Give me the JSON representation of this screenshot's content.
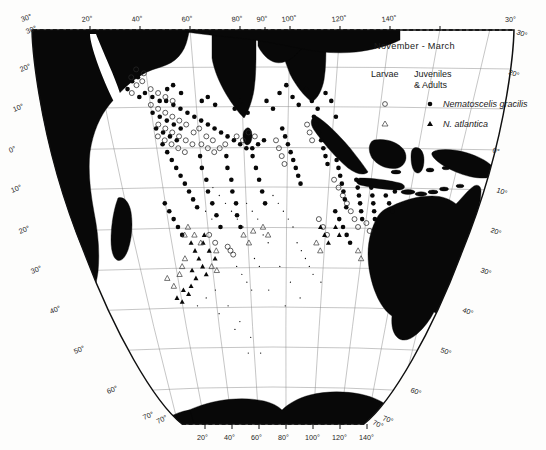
{
  "figure": {
    "kind": "distribution-map",
    "region": "Indian Ocean",
    "projection": "conic",
    "background": "#fdfdfc",
    "land_color": "#080808",
    "grid_color": "#8d8d8d"
  },
  "legend": {
    "season": "November - March",
    "col_larvae": "Larvae",
    "col_juv_line1": "Juveniles",
    "col_juv_line2": "& Adults",
    "entries": [
      {
        "species": "Nematoscelis gracilis",
        "larvae_symbol": "open-circle",
        "adult_symbol": "filled-circle"
      },
      {
        "species": "N. atlantica",
        "larvae_symbol": "open-triangle",
        "adult_symbol": "filled-triangle"
      }
    ]
  },
  "axes": {
    "top_longitudes": [
      "20°",
      "40°",
      "60°",
      "80°",
      "90°",
      "100°",
      "120°",
      "140°"
    ],
    "bottom_longitudes": [
      "20°",
      "40°",
      "60°",
      "80°",
      "100°",
      "120°",
      "140°"
    ],
    "left_latitudes": [
      "30°",
      "20°",
      "10°",
      "0°",
      "10°",
      "20°",
      "30°",
      "40°",
      "50°",
      "60°",
      "70°"
    ],
    "right_latitudes": [
      "30°",
      "20°",
      "0°",
      "10°",
      "20°",
      "30°",
      "40°",
      "50°",
      "60°",
      "70°"
    ],
    "corner_top_left": "30°",
    "corner_top_right": "30°",
    "corner_bottom_left": "70°",
    "corner_bottom_right": "70°"
  },
  "chart_data": {
    "type": "scatter",
    "title": "November - March",
    "xlabel": "Longitude (°E)",
    "ylabel": "Latitude",
    "xlim": [
      15,
      150
    ],
    "ylim": [
      -72,
      32
    ],
    "grid": true,
    "legend_position": "top-right",
    "series": [
      {
        "name": "Nematoscelis gracilis — Juveniles & Adults",
        "symbol": "filled-circle",
        "points": [
          [
            41,
            13
          ],
          [
            43,
            14
          ],
          [
            45,
            13
          ],
          [
            47,
            12
          ],
          [
            49,
            12
          ],
          [
            51,
            11
          ],
          [
            53,
            10
          ],
          [
            55,
            9
          ],
          [
            57,
            8
          ],
          [
            59,
            7
          ],
          [
            61,
            6
          ],
          [
            63,
            5
          ],
          [
            65,
            4
          ],
          [
            67,
            3
          ],
          [
            69,
            2
          ],
          [
            71,
            1
          ],
          [
            73,
            0
          ],
          [
            75,
            0
          ],
          [
            77,
            1
          ],
          [
            79,
            2
          ],
          [
            44,
            9
          ],
          [
            46,
            8
          ],
          [
            48,
            7
          ],
          [
            50,
            6
          ],
          [
            52,
            5
          ],
          [
            44,
            5
          ],
          [
            46,
            4
          ],
          [
            48,
            3
          ],
          [
            50,
            2
          ],
          [
            45,
            1
          ],
          [
            46,
            -1
          ],
          [
            47,
            -3
          ],
          [
            48,
            -5
          ],
          [
            49,
            -7
          ],
          [
            50,
            -9
          ],
          [
            51,
            -11
          ],
          [
            52,
            -13
          ],
          [
            53,
            -15
          ],
          [
            57,
            -2
          ],
          [
            57,
            -5
          ],
          [
            58,
            -8
          ],
          [
            58,
            -11
          ],
          [
            59,
            -14
          ],
          [
            60,
            -17
          ],
          [
            61,
            -20
          ],
          [
            66,
            -2
          ],
          [
            66,
            -5
          ],
          [
            67,
            -8
          ],
          [
            67,
            -11
          ],
          [
            68,
            -14
          ],
          [
            68,
            -17
          ],
          [
            69,
            -20
          ],
          [
            75,
            -2
          ],
          [
            76,
            -5
          ],
          [
            77,
            -8
          ],
          [
            78,
            -11
          ],
          [
            79,
            -14
          ],
          [
            85,
            5
          ],
          [
            86,
            3
          ],
          [
            87,
            1
          ],
          [
            88,
            -1
          ],
          [
            89,
            -3
          ],
          [
            90,
            -5
          ],
          [
            91,
            -7
          ],
          [
            92,
            -9
          ],
          [
            95,
            8
          ],
          [
            96,
            6
          ],
          [
            97,
            4
          ],
          [
            98,
            2
          ],
          [
            99,
            0
          ],
          [
            100,
            -2
          ],
          [
            101,
            -4
          ],
          [
            104,
            -3
          ],
          [
            105,
            -5
          ],
          [
            106,
            -7
          ],
          [
            107,
            -9
          ],
          [
            108,
            -11
          ],
          [
            109,
            -13
          ],
          [
            110,
            -15
          ],
          [
            112,
            -8
          ],
          [
            113,
            -10
          ],
          [
            114,
            -12
          ],
          [
            115,
            -14
          ],
          [
            116,
            -16
          ],
          [
            117,
            -18
          ],
          [
            118,
            -10
          ],
          [
            119,
            -12
          ],
          [
            120,
            -14
          ],
          [
            121,
            -16
          ],
          [
            122,
            -18
          ],
          [
            123,
            -20
          ],
          [
            110,
            -20
          ],
          [
            112,
            -22
          ],
          [
            114,
            -24
          ],
          [
            108,
            -18
          ],
          [
            106,
            -16
          ],
          [
            38,
            15
          ],
          [
            40,
            17
          ],
          [
            42,
            18
          ],
          [
            50,
            15
          ],
          [
            52,
            16
          ],
          [
            54,
            14
          ],
          [
            60,
            12
          ],
          [
            62,
            13
          ],
          [
            64,
            11
          ],
          [
            70,
            10
          ],
          [
            72,
            12
          ],
          [
            74,
            9
          ],
          [
            80,
            12
          ],
          [
            82,
            10
          ],
          [
            84,
            14
          ],
          [
            86,
            16
          ],
          [
            88,
            13
          ],
          [
            90,
            11
          ],
          [
            92,
            15
          ],
          [
            94,
            12
          ],
          [
            96,
            10
          ],
          [
            98,
            14
          ],
          [
            100,
            12
          ],
          [
            102,
            8
          ],
          [
            43,
            -18
          ],
          [
            44,
            -20
          ],
          [
            45,
            -22
          ],
          [
            42,
            -16
          ],
          [
            41,
            -14
          ],
          [
            124,
            -12
          ],
          [
            126,
            -14
          ],
          [
            128,
            -16
          ],
          [
            125,
            -9
          ],
          [
            127,
            -11
          ]
        ]
      },
      {
        "name": "Nematoscelis gracilis — Larvae",
        "symbol": "open-circle",
        "points": [
          [
            39,
            14
          ],
          [
            41,
            16
          ],
          [
            43,
            17
          ],
          [
            45,
            15
          ],
          [
            47,
            14
          ],
          [
            49,
            13
          ],
          [
            51,
            12
          ],
          [
            44,
            11
          ],
          [
            46,
            10
          ],
          [
            48,
            9
          ],
          [
            50,
            8
          ],
          [
            52,
            7
          ],
          [
            54,
            6
          ],
          [
            45,
            6
          ],
          [
            47,
            5
          ],
          [
            49,
            4
          ],
          [
            51,
            3
          ],
          [
            53,
            2
          ],
          [
            55,
            1
          ],
          [
            44,
            3
          ],
          [
            46,
            2
          ],
          [
            48,
            1
          ],
          [
            50,
            0
          ],
          [
            52,
            -1
          ],
          [
            58,
            1
          ],
          [
            60,
            0
          ],
          [
            62,
            -1
          ],
          [
            64,
            0
          ],
          [
            66,
            1
          ],
          [
            56,
            4
          ],
          [
            58,
            5
          ],
          [
            60,
            3
          ],
          [
            62,
            2
          ],
          [
            70,
            3
          ],
          [
            72,
            2
          ],
          [
            74,
            4
          ],
          [
            76,
            3
          ],
          [
            83,
            2
          ],
          [
            84,
            0
          ],
          [
            85,
            -2
          ],
          [
            86,
            -4
          ],
          [
            93,
            6
          ],
          [
            94,
            4
          ],
          [
            95,
            2
          ],
          [
            104,
            -8
          ],
          [
            106,
            -10
          ],
          [
            108,
            -12
          ],
          [
            110,
            -14
          ],
          [
            112,
            -16
          ],
          [
            114,
            -18
          ],
          [
            116,
            -20
          ],
          [
            64,
            -26
          ],
          [
            65,
            -27
          ],
          [
            63,
            -25
          ],
          [
            56,
            -22
          ],
          [
            58,
            -24
          ],
          [
            100,
            -18
          ],
          [
            102,
            -20
          ],
          [
            104,
            -22
          ],
          [
            40,
            18
          ],
          [
            42,
            20
          ],
          [
            44,
            19
          ],
          [
            119,
            -19
          ],
          [
            121,
            -21
          ]
        ]
      },
      {
        "name": "N. atlantica — Juveniles & Adults",
        "symbol": "filled-triangle",
        "points": [
          [
            48,
            -24
          ],
          [
            49,
            -26
          ],
          [
            50,
            -28
          ],
          [
            51,
            -30
          ],
          [
            52,
            -32
          ],
          [
            55,
            -26
          ],
          [
            57,
            -28
          ],
          [
            46,
            -31
          ],
          [
            47,
            -33
          ],
          [
            44,
            -35
          ],
          [
            42,
            -37
          ],
          [
            40,
            -36
          ],
          [
            53,
            -24
          ],
          [
            54,
            -22
          ],
          [
            103,
            -22
          ],
          [
            105,
            -24
          ],
          [
            101,
            -20
          ],
          [
            107,
            -20
          ],
          [
            109,
            -22
          ],
          [
            36,
            -38
          ],
          [
            38,
            -39
          ]
        ]
      },
      {
        "name": "N. atlantica — Larvae",
        "symbol": "open-triangle",
        "points": [
          [
            46,
            -22
          ],
          [
            48,
            -20
          ],
          [
            50,
            -22
          ],
          [
            52,
            -24
          ],
          [
            55,
            -30
          ],
          [
            57,
            -31
          ],
          [
            58,
            -26
          ],
          [
            44,
            -28
          ],
          [
            42,
            -30
          ],
          [
            40,
            -32
          ],
          [
            70,
            -22
          ],
          [
            72,
            -24
          ],
          [
            74,
            -21
          ],
          [
            36,
            -35
          ],
          [
            34,
            -33
          ],
          [
            100,
            -24
          ],
          [
            102,
            -26
          ],
          [
            118,
            -26
          ],
          [
            120,
            -28
          ],
          [
            78,
            -20
          ],
          [
            80,
            -22
          ]
        ]
      },
      {
        "name": "Stations without catch",
        "symbol": "tiny-dot",
        "points": [
          [
            60,
            -10
          ],
          [
            62,
            -12
          ],
          [
            64,
            -14
          ],
          [
            66,
            -16
          ],
          [
            68,
            -18
          ],
          [
            70,
            -20
          ],
          [
            72,
            -14
          ],
          [
            74,
            -16
          ],
          [
            76,
            -18
          ],
          [
            78,
            -22
          ],
          [
            80,
            -24
          ],
          [
            82,
            -12
          ],
          [
            84,
            -14
          ],
          [
            86,
            -16
          ],
          [
            88,
            -18
          ],
          [
            90,
            -20
          ],
          [
            55,
            -36
          ],
          [
            60,
            -40
          ],
          [
            65,
            -44
          ],
          [
            70,
            -48
          ],
          [
            75,
            -52
          ],
          [
            85,
            -30
          ],
          [
            90,
            -34
          ],
          [
            95,
            -38
          ],
          [
            50,
            -38
          ],
          [
            45,
            -40
          ],
          [
            55,
            -42
          ],
          [
            80,
            -36
          ],
          [
            88,
            -40
          ],
          [
            92,
            -24
          ],
          [
            94,
            -26
          ],
          [
            96,
            -28
          ],
          [
            98,
            -30
          ],
          [
            66,
            -30
          ],
          [
            68,
            -32
          ],
          [
            70,
            -34
          ],
          [
            72,
            -36
          ],
          [
            100,
            -32
          ],
          [
            104,
            -34
          ],
          [
            62,
            -46
          ],
          [
            68,
            -52
          ],
          [
            74,
            -28
          ],
          [
            76,
            -30
          ],
          [
            58,
            -18
          ],
          [
            56,
            -16
          ]
        ]
      }
    ]
  }
}
